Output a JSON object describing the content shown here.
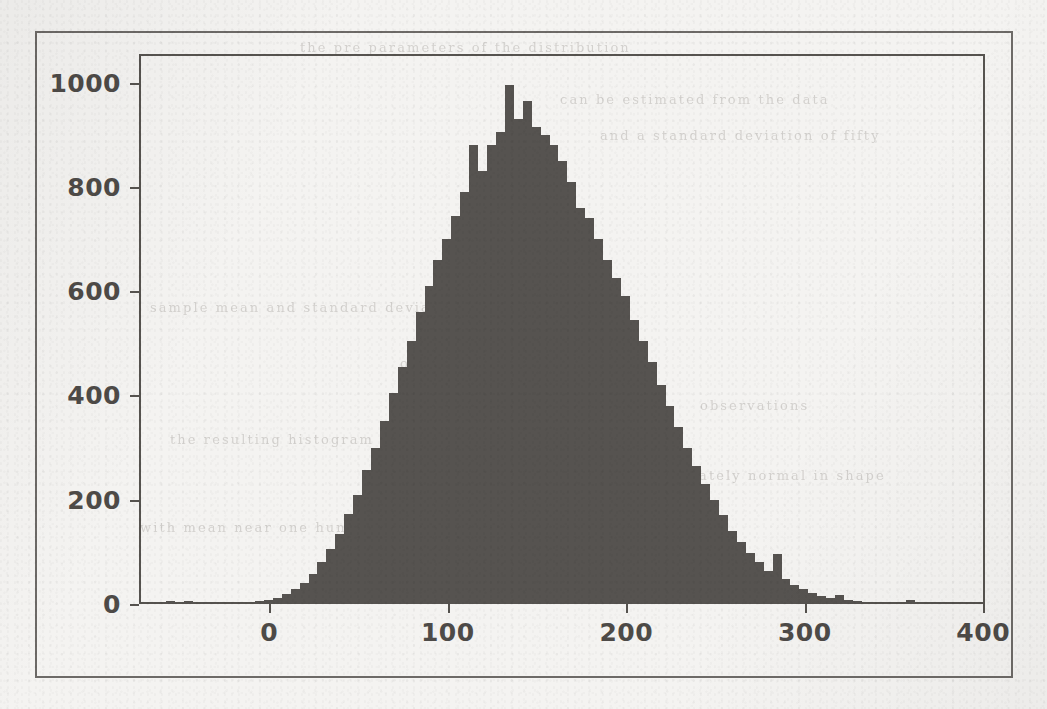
{
  "figure": {
    "kind": "histogram-figure",
    "frame_color": "#6d6a67",
    "axes_color": "#56534f",
    "bar_color": "#565350",
    "page_background": "#f4f3f1"
  },
  "bleed_text": [
    {
      "text": "the pre parameters of the distribution",
      "x": 300,
      "y": 40
    },
    {
      "text": "can be estimated from the data",
      "x": 560,
      "y": 92
    },
    {
      "text": "sample mean and standard deviation",
      "x": 150,
      "y": 300
    },
    {
      "text": "of the simulated values",
      "x": 400,
      "y": 356
    },
    {
      "text": "the resulting histogram is shown",
      "x": 170,
      "y": 432
    },
    {
      "text": "approximately normal in shape",
      "x": 620,
      "y": 468
    },
    {
      "text": "with mean near one hundred fifty",
      "x": 140,
      "y": 520
    },
    {
      "text": "and a standard deviation of fifty",
      "x": 600,
      "y": 128
    },
    {
      "text": "observations",
      "x": 700,
      "y": 398
    }
  ],
  "chart_data": {
    "type": "bar",
    "subtype": "histogram",
    "title": "",
    "xlabel": "",
    "ylabel": "",
    "xlim": [
      -73,
      401
    ],
    "ylim": [
      0,
      1055
    ],
    "xticks": [
      0,
      100,
      200,
      300,
      400
    ],
    "xtick_labels": [
      "0",
      "100",
      "200",
      "300",
      "400"
    ],
    "yticks": [
      0,
      200,
      400,
      600,
      800,
      1000
    ],
    "ytick_labels": [
      "0",
      "200",
      "400",
      "600",
      "800",
      "1000"
    ],
    "grid": false,
    "legend": null,
    "bin_width": 5,
    "bin_starts": [
      -73,
      -68,
      -63,
      -58,
      -53,
      -48,
      -43,
      -38,
      -33,
      -28,
      -23,
      -18,
      -13,
      -8,
      -3,
      2,
      7,
      12,
      17,
      22,
      27,
      32,
      37,
      42,
      47,
      52,
      57,
      62,
      67,
      72,
      77,
      82,
      87,
      92,
      97,
      102,
      107,
      112,
      117,
      122,
      127,
      132,
      137,
      142,
      147,
      152,
      157,
      162,
      167,
      172,
      177,
      182,
      187,
      192,
      197,
      202,
      207,
      212,
      217,
      222,
      227,
      232,
      237,
      242,
      247,
      252,
      257,
      262,
      267,
      272,
      277,
      282,
      287,
      292,
      297,
      302,
      307,
      312,
      317,
      322,
      327,
      332,
      337,
      342,
      347,
      352,
      357,
      362,
      367,
      372,
      377,
      382,
      387,
      392,
      397
    ],
    "values": [
      0,
      0,
      0,
      6,
      0,
      5,
      0,
      4,
      0,
      0,
      0,
      0,
      0,
      5,
      8,
      12,
      20,
      28,
      40,
      58,
      80,
      105,
      135,
      172,
      210,
      258,
      300,
      352,
      405,
      455,
      505,
      560,
      610,
      660,
      700,
      745,
      790,
      880,
      830,
      880,
      905,
      995,
      930,
      965,
      915,
      900,
      880,
      850,
      810,
      760,
      740,
      700,
      660,
      625,
      590,
      545,
      505,
      465,
      420,
      380,
      340,
      300,
      265,
      230,
      200,
      170,
      140,
      118,
      98,
      80,
      63,
      95,
      48,
      36,
      28,
      22,
      16,
      11,
      18,
      8,
      5,
      0,
      0,
      0,
      0,
      0,
      7,
      0,
      0,
      0,
      0,
      0,
      0,
      0,
      0
    ]
  }
}
